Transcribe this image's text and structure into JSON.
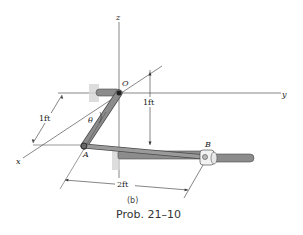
{
  "figure": {
    "caption": "Prob. 21–10",
    "subfigure_label": "(b)"
  },
  "axes": {
    "x_label": "x",
    "y_label": "y",
    "z_label": "z"
  },
  "points": {
    "origin": "O",
    "a": "A",
    "b": "B"
  },
  "angle": {
    "label": "θ"
  },
  "dimensions": {
    "ox_distance": "1ft",
    "vertical_distance": "1ft",
    "ab_distance": "2ft"
  },
  "colors": {
    "rod_fill": "#8c8c8c",
    "rod_edge": "#4a4a4a",
    "bracket": "#cfcfcf",
    "line": "#333333"
  }
}
